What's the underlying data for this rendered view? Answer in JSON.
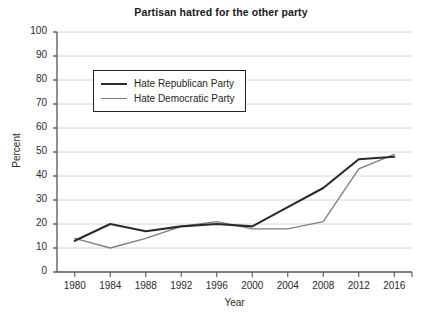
{
  "chart_data": {
    "type": "line",
    "title": "Partisan hatred for the other party",
    "xlabel": "Year",
    "ylabel": "Percent",
    "xlim": [
      1978,
      2018
    ],
    "ylim": [
      0,
      100
    ],
    "grid": true,
    "legend_position": "upper-left inside",
    "x": [
      1980,
      1984,
      1988,
      1992,
      1996,
      2000,
      2004,
      2008,
      2012,
      2016
    ],
    "xticks": [
      "1980",
      "1984",
      "1988",
      "1992",
      "1996",
      "2000",
      "2004",
      "2008",
      "2012",
      "2016"
    ],
    "yticks": [
      "0",
      "10",
      "20",
      "30",
      "40",
      "50",
      "60",
      "70",
      "80",
      "90",
      "100"
    ],
    "series": [
      {
        "name": "Hate Republican Party",
        "color": "#2b2b2b",
        "values": [
          13,
          20,
          17,
          19,
          20,
          19,
          27,
          35,
          47,
          48
        ]
      },
      {
        "name": "Hate Democratic Party",
        "color": "#7e7e7e",
        "values": [
          14,
          10,
          14,
          19,
          21,
          18,
          18,
          21,
          43,
          49
        ]
      }
    ]
  },
  "legend": {
    "items": [
      {
        "label": "Hate Republican Party"
      },
      {
        "label": "Hate Democratic Party"
      }
    ]
  },
  "colors": {
    "republican_line": "#2b2b2b",
    "democratic_line": "#7e7e7e",
    "gridline": "#d6d6d6",
    "axis": "#555555",
    "text": "#1f1f1f",
    "background": "#ffffff"
  }
}
